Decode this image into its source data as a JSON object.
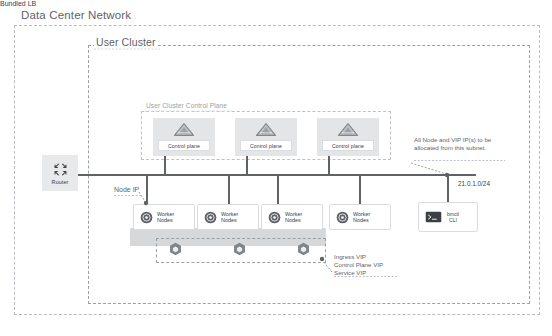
{
  "diagram": {
    "outer_zone_label": "Data Center Network",
    "cluster_zone_label": "User Cluster",
    "control_plane_zone_label": "User Cluster Control Plane",
    "bundled_lb_label": "Bundled LB"
  },
  "router": {
    "label": "Router",
    "icon": "four-arrows-icon"
  },
  "control_planes": [
    {
      "label": "Control plane",
      "icon": "triangle-icon"
    },
    {
      "label": "Control plane",
      "icon": "triangle-icon"
    },
    {
      "label": "Control plane",
      "icon": "triangle-icon"
    }
  ],
  "worker_nodes": [
    {
      "label_line1": "Worker",
      "label_line2": "Nodes",
      "icon": "disc-icon",
      "has_lb": true
    },
    {
      "label_line1": "Worker",
      "label_line2": "Nodes",
      "icon": "disc-icon",
      "has_lb": true
    },
    {
      "label_line1": "Worker",
      "label_line2": "Nodes",
      "icon": "disc-icon",
      "has_lb": true
    },
    {
      "label_line1": "Worker",
      "label_line2": "Nodes",
      "icon": "disc-icon",
      "has_lb": false
    }
  ],
  "load_balancers": [
    {
      "icon": "hexagon-lb-icon"
    },
    {
      "icon": "hexagon-lb-icon"
    },
    {
      "icon": "hexagon-lb-icon"
    }
  ],
  "cli": {
    "label_line1": "bmctl",
    "label_line2": "CLI",
    "icon": "terminal-icon"
  },
  "annotations": {
    "node_ip": "Node IP",
    "subnet_note": "All Node and VIP IP(s) to be allocated from this subnet.",
    "cidr": "21.0.1.0/24",
    "vip_line1": "Ingress VIP",
    "vip_line2": "Control Plane VIP",
    "vip_line3": "Service VIP"
  },
  "colors": {
    "line": "#5f6368",
    "dashed_border": "#9aa0a6",
    "card_fill": "#ffffff",
    "cp_fill": "#e4e5e7",
    "band_fill": "#d6d8da",
    "text": "#3c4043",
    "muted_text": "#9aa0a6"
  }
}
